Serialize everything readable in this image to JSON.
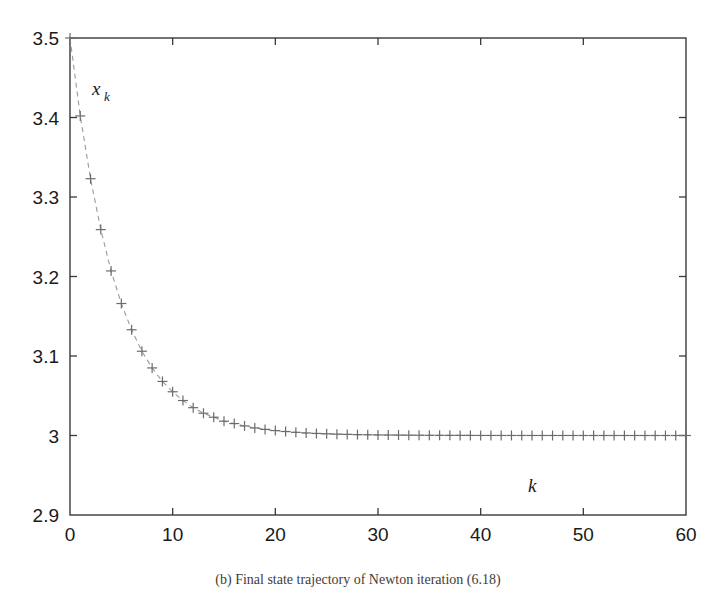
{
  "figure": {
    "caption": "(b) Final state trajectory of Newton iteration (6.18)",
    "background_color": "#ffffff",
    "frame_color": "#3a3a3a",
    "marker_color": "#6b6b6b",
    "line_color": "#9a9a9a"
  },
  "chart_data": {
    "type": "line",
    "title": "",
    "subtitle": "",
    "xlabel": "k",
    "ylabel": "x_k",
    "ylabel_display": "x",
    "ylabel_subscript": "k",
    "xlim": [
      0,
      60
    ],
    "ylim": [
      2.9,
      3.5
    ],
    "grid": false,
    "legend": null,
    "legend_position": "none",
    "marker": "+",
    "linestyle": "dashed",
    "xticks": [
      0,
      10,
      20,
      30,
      40,
      50,
      60
    ],
    "xtick_labels": [
      "0",
      "10",
      "20",
      "30",
      "40",
      "50",
      "60"
    ],
    "yticks": [
      2.9,
      3.0,
      3.1,
      3.2,
      3.3,
      3.4,
      3.5
    ],
    "ytick_labels": [
      "2.9",
      "3",
      "3.1",
      "3.2",
      "3.3",
      "3.4",
      "3.5"
    ],
    "series": [
      {
        "name": "x_k",
        "x": [
          0,
          1,
          2,
          3,
          4,
          5,
          6,
          7,
          8,
          9,
          10,
          11,
          12,
          13,
          14,
          15,
          16,
          17,
          18,
          19,
          20,
          21,
          22,
          23,
          24,
          25,
          26,
          27,
          28,
          29,
          30,
          31,
          32,
          33,
          34,
          35,
          36,
          37,
          38,
          39,
          40,
          41,
          42,
          43,
          44,
          45,
          46,
          47,
          48,
          49,
          50,
          51,
          52,
          53,
          54,
          55,
          56,
          57,
          58,
          59,
          60
        ],
        "values": [
          3.5,
          3.402,
          3.323,
          3.259,
          3.207,
          3.166,
          3.133,
          3.106,
          3.085,
          3.068,
          3.055,
          3.044,
          3.035,
          3.028,
          3.023,
          3.018,
          3.015,
          3.012,
          3.0095,
          3.0077,
          3.0062,
          3.005,
          3.004,
          3.0032,
          3.0026,
          3.0021,
          3.0017,
          3.0014,
          3.0011,
          3.0009,
          3.0007,
          3.0006,
          3.0005,
          3.0004,
          3.0003,
          3.00025,
          3.0002,
          3.00016,
          3.00013,
          3.0001,
          3.00008,
          3.00007,
          3.00006,
          3.00005,
          3.00004,
          3.00003,
          3.00002,
          3.00002,
          3.00001,
          3.00001,
          3.00001,
          3.0,
          3.0,
          3.0,
          3.0,
          3.0,
          3.0,
          3.0,
          3.0,
          3.0,
          3.0
        ]
      }
    ]
  }
}
